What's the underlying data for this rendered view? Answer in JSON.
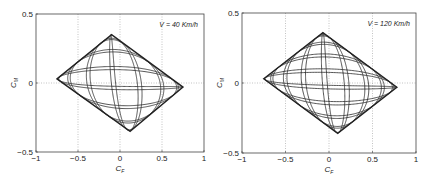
{
  "chart_data": [
    {
      "type": "line",
      "title": "",
      "annotation": "V = 40 Km/h",
      "xlabel": "C_F",
      "ylabel": "C_M",
      "xlim": [
        -1,
        1
      ],
      "ylim": [
        -0.5,
        0.5
      ],
      "xticks": [
        -1,
        -0.5,
        0,
        0.5,
        1
      ],
      "xtick_labels": [
        "-1",
        "-0.5",
        "0",
        "0.5",
        "1"
      ],
      "yticks": [
        -0.5,
        0,
        0.5
      ],
      "ytick_labels": [
        "-0.5",
        "0",
        "0.5"
      ],
      "grid": true,
      "envelope": {
        "left": [
          -0.75,
          0.03
        ],
        "top": [
          -0.1,
          0.35
        ],
        "right": [
          0.75,
          -0.03
        ],
        "bottom": [
          0.12,
          -0.35
        ]
      },
      "n_cycles": 7,
      "description": "Lissajous-type CF-CM trajectories filling a rotated rectangular envelope"
    },
    {
      "type": "line",
      "title": "",
      "annotation": "V = 120 Km/h",
      "xlabel": "C_F",
      "ylabel": "C_M",
      "xlim": [
        -1,
        1
      ],
      "ylim": [
        -0.5,
        0.5
      ],
      "xticks": [
        -1,
        -0.5,
        0,
        0.5,
        1
      ],
      "xtick_labels": [
        "-1",
        "-0.5",
        "0",
        "0.5",
        "1"
      ],
      "yticks": [
        -0.5,
        0,
        0.5
      ],
      "ytick_labels": [
        "-0.5",
        "0",
        "0.5"
      ],
      "grid": true,
      "envelope": {
        "left": [
          -0.75,
          0.03
        ],
        "top": [
          -0.07,
          0.36
        ],
        "right": [
          0.78,
          -0.03
        ],
        "bottom": [
          0.1,
          -0.36
        ]
      },
      "n_cycles": 9,
      "description": "Lissajous-type CF-CM trajectories filling a rotated rectangular envelope"
    }
  ],
  "panels": [
    {
      "box": [
        36,
        14,
        204,
        152
      ]
    },
    {
      "box": [
        242,
        13,
        416,
        153
      ]
    }
  ]
}
